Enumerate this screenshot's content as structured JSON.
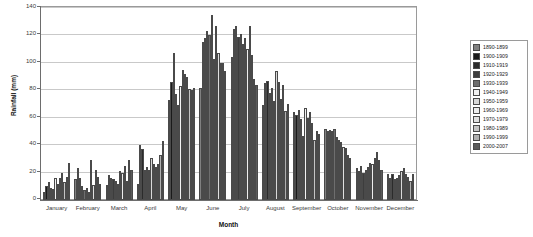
{
  "chart_data": {
    "type": "bar",
    "title": "",
    "xlabel": "Month",
    "ylabel": "Rainfall (mm)",
    "ylim": [
      0,
      140
    ],
    "ytick_labels": [
      "0",
      "20",
      "40",
      "60",
      "80",
      "100",
      "120",
      "140"
    ],
    "ytick_values": [
      0,
      20,
      40,
      60,
      80,
      100,
      120,
      140
    ],
    "grid": true,
    "legend_position": "right",
    "categories": [
      "January",
      "February",
      "March",
      "April",
      "May",
      "June",
      "July",
      "August",
      "September",
      "October",
      "November",
      "December"
    ],
    "series": [
      {
        "name": "1890-1899",
        "color": "#808080",
        "values": [
          6,
          15,
          11,
          12,
          73,
          82,
          104,
          69,
          64,
          52,
          23,
          19
        ]
      },
      {
        "name": "1900-1909",
        "color": "#1a1a1a",
        "values": [
          10,
          23,
          18,
          40,
          86,
          115,
          125,
          85,
          62,
          50,
          21,
          16
        ]
      },
      {
        "name": "1910-1919",
        "color": "#2b2b2b",
        "values": [
          13,
          16,
          16,
          37,
          107,
          118,
          127,
          87,
          66,
          51,
          25,
          19
        ]
      },
      {
        "name": "1920-1929",
        "color": "#3d3d3d",
        "values": [
          9,
          10,
          15,
          22,
          77,
          123,
          119,
          78,
          59,
          50,
          20,
          15
        ]
      },
      {
        "name": "1930-1939",
        "color": "#6e6e6e",
        "values": [
          8,
          7,
          14,
          24,
          69,
          120,
          121,
          82,
          47,
          52,
          22,
          16
        ]
      },
      {
        "name": "1940-1949",
        "color": "#f2f2f2",
        "values": [
          16,
          9,
          12,
          22,
          83,
          135,
          114,
          72,
          67,
          46,
          24,
          18
        ]
      },
      {
        "name": "1950-1959",
        "color": "#d9d9d9",
        "values": [
          12,
          6,
          21,
          31,
          95,
          103,
          118,
          94,
          60,
          44,
          27,
          21
        ]
      },
      {
        "name": "1960-1969",
        "color": "#ededed",
        "values": [
          16,
          29,
          20,
          26,
          92,
          127,
          110,
          86,
          64,
          42,
          26,
          23
        ]
      },
      {
        "name": "1970-1979",
        "color": "#e0e0e0",
        "values": [
          20,
          11,
          25,
          24,
          90,
          107,
          127,
          74,
          56,
          39,
          31,
          19
        ]
      },
      {
        "name": "1980-1989",
        "color": "#c4c4c4",
        "values": [
          13,
          22,
          14,
          26,
          81,
          100,
          106,
          84,
          44,
          38,
          35,
          17
        ]
      },
      {
        "name": "1990-1999",
        "color": "#b0b0b0",
        "values": [
          17,
          17,
          29,
          33,
          80,
          100,
          88,
          65,
          50,
          33,
          29,
          14
        ]
      },
      {
        "name": "2000-2007",
        "color": "#5a5a5a",
        "values": [
          27,
          12,
          22,
          43,
          82,
          94,
          84,
          70,
          48,
          31,
          22,
          19
        ]
      }
    ]
  },
  "legend": {
    "items": [
      {
        "label": "1890-1899"
      },
      {
        "label": "1900-1909"
      },
      {
        "label": "1910-1919"
      },
      {
        "label": "1920-1929"
      },
      {
        "label": "1930-1939"
      },
      {
        "label": "1940-1949"
      },
      {
        "label": "1950-1959"
      },
      {
        "label": "1960-1969"
      },
      {
        "label": "1970-1979"
      },
      {
        "label": "1980-1989"
      },
      {
        "label": "1990-1999"
      },
      {
        "label": "2000-2007"
      }
    ]
  }
}
